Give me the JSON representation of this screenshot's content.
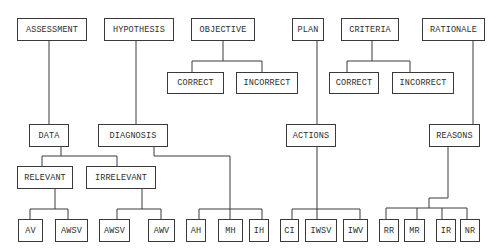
{
  "diagram": {
    "top": {
      "assessment": "ASSESSMENT",
      "hypothesis": "HYPOTHESIS",
      "objective": "OBJECTIVE",
      "plan": "PLAN",
      "criteria": "CRITERIA",
      "rationale": "RATIONALE"
    },
    "objective_children": [
      "CORRECT",
      "INCORRECT"
    ],
    "criteria_children": [
      "CORRECT",
      "INCORRECT"
    ],
    "middle": {
      "data": "DATA",
      "diagnosis": "DIAGNOSIS",
      "actions": "ACTIONS",
      "reasons": "REASONS"
    },
    "data_children": {
      "relevant": "RELEVANT",
      "irrelevant": "IRRELEVANT"
    },
    "leaves": {
      "relevant": [
        "AV",
        "AWSV"
      ],
      "irrelevant": [
        "AWSV",
        "AWV"
      ],
      "diagnosis": [
        "AH",
        "MH",
        "IH"
      ],
      "actions": [
        "CI",
        "IWSV",
        "IWV"
      ],
      "reasons": [
        "RR",
        "MR",
        "IR",
        "NR"
      ]
    }
  }
}
